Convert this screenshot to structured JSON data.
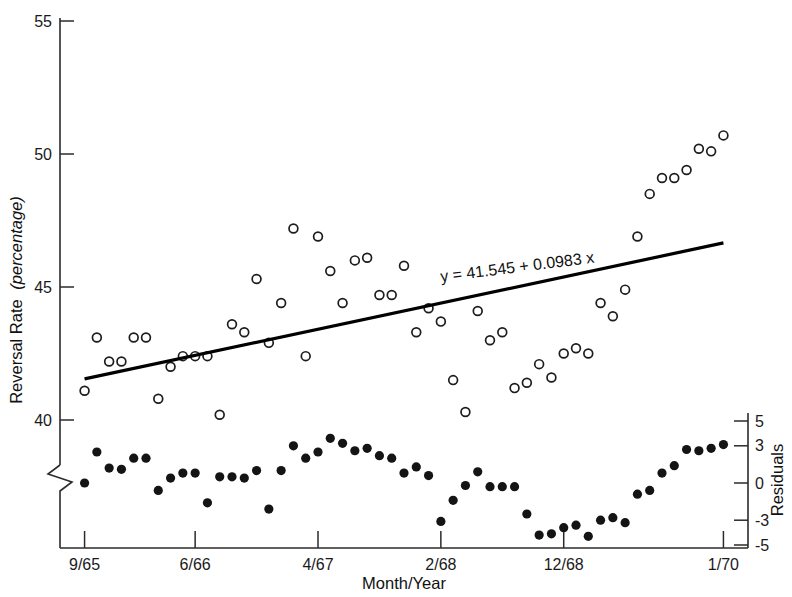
{
  "chart_data": {
    "type": "scatter",
    "title": "",
    "xlabel": "Month/Year",
    "ylabel": "Reversal Rate (percentage)",
    "ylabel_plain": "Reversal Rate",
    "ylabel_italic": "(percentage)",
    "y2label": "Residuals",
    "grid": false,
    "legend_position": "none",
    "annotations": [
      {
        "name": "regression-equation",
        "text": "y = 41.545 + 0.0983 x",
        "x_px": 441,
        "y_px": 282,
        "rotation_deg": -7.2
      }
    ],
    "x_axis": {
      "tick_labels": [
        "9/65",
        "6/66",
        "4/67",
        "2/68",
        "12/68",
        "1/70"
      ],
      "tick_values": [
        0,
        9,
        19,
        29,
        39,
        52
      ],
      "range": [
        -2,
        54
      ]
    },
    "y_axis_left": {
      "tick_labels": [
        "55",
        "50",
        "45",
        "40"
      ],
      "tick_values": [
        55,
        50,
        45,
        40
      ],
      "range": [
        38.6,
        55.6
      ],
      "axis_break": true,
      "axis_break_note": "zigzag break below 40 separating reversal-rate panel from residual panel"
    },
    "y_axis_right": {
      "tick_labels": [
        "5",
        "3",
        "0",
        "-3",
        "-5"
      ],
      "tick_values": [
        5,
        3,
        0,
        -3,
        -5
      ],
      "range": [
        -5,
        5
      ]
    },
    "series": [
      {
        "name": "Reversal rate",
        "marker": "open-circle",
        "points": [
          [
            0,
            41.1
          ],
          [
            1,
            43.1
          ],
          [
            2,
            42.2
          ],
          [
            3,
            42.2
          ],
          [
            4,
            43.1
          ],
          [
            5,
            43.1
          ],
          [
            6,
            40.8
          ],
          [
            7,
            42.0
          ],
          [
            8,
            42.4
          ],
          [
            9,
            42.4
          ],
          [
            10,
            42.4
          ],
          [
            11,
            40.2
          ],
          [
            12,
            43.6
          ],
          [
            13,
            43.3
          ],
          [
            14,
            45.3
          ],
          [
            15,
            42.9
          ],
          [
            16,
            44.4
          ],
          [
            17,
            47.2
          ],
          [
            18,
            42.4
          ],
          [
            19,
            46.9
          ],
          [
            20,
            45.6
          ],
          [
            21,
            44.4
          ],
          [
            22,
            46.0
          ],
          [
            23,
            46.1
          ],
          [
            24,
            44.7
          ],
          [
            25,
            44.7
          ],
          [
            26,
            45.8
          ],
          [
            27,
            43.3
          ],
          [
            28,
            44.2
          ],
          [
            29,
            43.7
          ],
          [
            30,
            41.5
          ],
          [
            31,
            40.3
          ],
          [
            32,
            44.1
          ],
          [
            33,
            43.0
          ],
          [
            34,
            43.3
          ],
          [
            35,
            41.2
          ],
          [
            36,
            41.4
          ],
          [
            37,
            42.1
          ],
          [
            38,
            41.6
          ],
          [
            39,
            42.5
          ],
          [
            40,
            42.7
          ],
          [
            41,
            42.5
          ],
          [
            42,
            44.4
          ],
          [
            43,
            43.9
          ],
          [
            44,
            44.9
          ],
          [
            45,
            46.9
          ],
          [
            46,
            48.5
          ],
          [
            47,
            49.1
          ],
          [
            48,
            49.1
          ],
          [
            49,
            49.4
          ],
          [
            50,
            50.2
          ],
          [
            51,
            50.1
          ],
          [
            52,
            50.7
          ]
        ]
      },
      {
        "name": "Residuals",
        "marker": "solid-circle",
        "points": [
          [
            0,
            0.0
          ],
          [
            1,
            2.5
          ],
          [
            2,
            1.2
          ],
          [
            3,
            1.1
          ],
          [
            4,
            2.0
          ],
          [
            5,
            2.0
          ],
          [
            6,
            -0.6
          ],
          [
            7,
            0.4
          ],
          [
            8,
            0.8
          ],
          [
            9,
            0.8
          ],
          [
            10,
            -1.6
          ],
          [
            11,
            0.5
          ],
          [
            12,
            0.5
          ],
          [
            13,
            0.4
          ],
          [
            14,
            1.0
          ],
          [
            15,
            -2.1
          ],
          [
            16,
            1.0
          ],
          [
            17,
            3.0
          ],
          [
            18,
            2.0
          ],
          [
            19,
            2.5
          ],
          [
            20,
            3.6
          ],
          [
            21,
            3.2
          ],
          [
            22,
            2.6
          ],
          [
            23,
            2.8
          ],
          [
            24,
            2.2
          ],
          [
            25,
            2.0
          ],
          [
            26,
            0.8
          ],
          [
            27,
            1.3
          ],
          [
            28,
            0.6
          ],
          [
            29,
            -3.1
          ],
          [
            30,
            -1.4
          ],
          [
            31,
            -0.2
          ],
          [
            32,
            0.9
          ],
          [
            33,
            -0.3
          ],
          [
            34,
            -0.3
          ],
          [
            35,
            -0.3
          ],
          [
            36,
            -2.5
          ],
          [
            37,
            -4.2
          ],
          [
            38,
            -4.1
          ],
          [
            39,
            -3.6
          ],
          [
            40,
            -3.4
          ],
          [
            41,
            -4.3
          ],
          [
            42,
            -3.0
          ],
          [
            43,
            -2.8
          ],
          [
            44,
            -3.2
          ],
          [
            45,
            -0.9
          ],
          [
            46,
            -0.6
          ],
          [
            47,
            0.8
          ],
          [
            48,
            1.4
          ],
          [
            49,
            2.7
          ],
          [
            50,
            2.6
          ],
          [
            51,
            2.8
          ],
          [
            52,
            3.1
          ]
        ]
      }
    ],
    "fit_line": {
      "name": "least-squares-fit",
      "equation": "y = 41.545 + 0.0983 x",
      "intercept": 41.545,
      "slope": 0.0983,
      "x_start": 0,
      "x_end": 52
    }
  }
}
